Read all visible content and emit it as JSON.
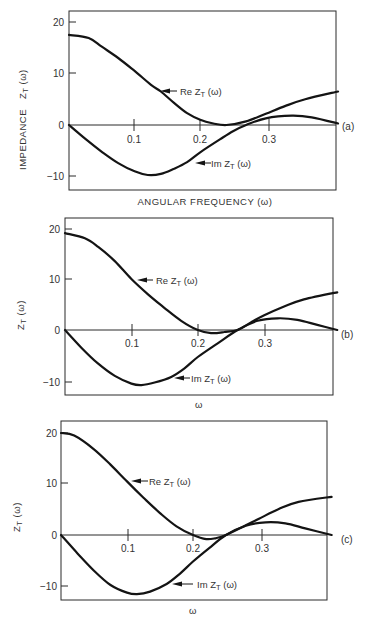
{
  "figure": {
    "panels": [
      {
        "id": "a",
        "panel_label": "(a)",
        "ylabel": "IMPEDANCE  Z_T (ω)",
        "ylabel_main": "IMPEDANCE",
        "ylabel_sym": "Z",
        "ylabel_sub": "T",
        "ylabel_arg": " (ω)",
        "xlabel": "ANGULAR FREQUENCY  (ω)",
        "re_label": "Re Z",
        "im_label": "Im Z",
        "label_sub": "T",
        "label_arg": " (ω)"
      },
      {
        "id": "b",
        "panel_label": "(b)",
        "ylabel": "Z_T (ω)",
        "ylabel_sym": "Z",
        "ylabel_sub": "T",
        "ylabel_arg": " (ω)",
        "xlabel": "ω",
        "re_label": "Re Z",
        "im_label": "Im Z",
        "label_sub": "T",
        "label_arg": " (ω)"
      },
      {
        "id": "c",
        "panel_label": "(c)",
        "ylabel": "Z_T (ω)",
        "ylabel_sym": "Z",
        "ylabel_sub": "T",
        "ylabel_arg": " (ω)",
        "xlabel": "ω",
        "re_label": "Re Z",
        "im_label": "Im Z",
        "label_sub": "T",
        "label_arg": " (ω)"
      }
    ],
    "ytick_labels": [
      "20",
      "10",
      "0",
      "−10"
    ],
    "xtick_labels": [
      "0.1",
      "0.2",
      "0.3"
    ],
    "colors": {
      "curve": "#141414",
      "axis": "#2a2a2a",
      "text": "#333333",
      "background": "#ffffff"
    }
  },
  "chart_data": [
    {
      "type": "line",
      "title": "(a)",
      "xlabel": "ANGULAR FREQUENCY (ω)",
      "ylabel": "IMPEDANCE Z_T(ω)",
      "xlim": [
        0,
        0.41
      ],
      "ylim": [
        -12,
        22
      ],
      "xticks": [
        0.1,
        0.2,
        0.3
      ],
      "yticks": [
        -10,
        0,
        10,
        20
      ],
      "grid": false,
      "legend": "inline arrow annotations",
      "series": [
        {
          "name": "Re Z_T(ω)",
          "x": [
            0,
            0.03,
            0.05,
            0.075,
            0.1,
            0.125,
            0.14,
            0.16,
            0.18,
            0.2,
            0.22,
            0.24,
            0.27,
            0.3,
            0.33,
            0.36,
            0.41
          ],
          "values": [
            17.5,
            16.9,
            15.2,
            13.0,
            10.5,
            7.8,
            6.5,
            4.3,
            2.3,
            1.0,
            0.3,
            0.0,
            0.7,
            2.2,
            3.7,
            5.0,
            6.5
          ]
        },
        {
          "name": "Im Z_T(ω)",
          "x": [
            0,
            0.025,
            0.05,
            0.075,
            0.1,
            0.12,
            0.14,
            0.16,
            0.18,
            0.2,
            0.23,
            0.25,
            0.27,
            0.3,
            0.34,
            0.37,
            0.41
          ],
          "values": [
            0,
            -2.7,
            -5.2,
            -7.4,
            -9.0,
            -9.7,
            -9.5,
            -8.5,
            -7.2,
            -5.3,
            -2.8,
            -1.2,
            0.0,
            1.3,
            1.8,
            1.5,
            0.3
          ]
        }
      ],
      "annotations": [
        "Re Z_T (ω)",
        "Im Z_T (ω)",
        "(a)"
      ]
    },
    {
      "type": "line",
      "title": "(b)",
      "xlabel": "ω",
      "ylabel": "Z_T(ω)",
      "xlim": [
        0,
        0.41
      ],
      "ylim": [
        -12,
        22
      ],
      "xticks": [
        0.1,
        0.2,
        0.3
      ],
      "yticks": [
        -10,
        0,
        10,
        20
      ],
      "grid": false,
      "legend": "inline arrow annotations",
      "series": [
        {
          "name": "Re Z_T(ω)",
          "x": [
            0,
            0.03,
            0.05,
            0.075,
            0.1,
            0.125,
            0.15,
            0.175,
            0.2,
            0.22,
            0.24,
            0.26,
            0.28,
            0.3,
            0.33,
            0.36,
            0.41
          ],
          "values": [
            19.0,
            18.0,
            16.3,
            13.5,
            10.0,
            7.0,
            4.3,
            1.8,
            0.0,
            -0.6,
            -0.4,
            0.0,
            1.5,
            2.9,
            4.6,
            6.0,
            7.4
          ]
        },
        {
          "name": "Im Z_T(ω)",
          "x": [
            0,
            0.025,
            0.05,
            0.075,
            0.1,
            0.115,
            0.135,
            0.16,
            0.18,
            0.2,
            0.23,
            0.26,
            0.29,
            0.32,
            0.35,
            0.38,
            0.41
          ],
          "values": [
            0,
            -3.5,
            -6.6,
            -9.0,
            -10.5,
            -10.8,
            -10.3,
            -9.2,
            -7.5,
            -5.3,
            -2.6,
            0.0,
            1.8,
            2.3,
            2.0,
            1.0,
            0.0
          ]
        }
      ],
      "annotations": [
        "Re Z_T (ω)",
        "Im Z_T (ω)",
        "(b)"
      ]
    },
    {
      "type": "line",
      "title": "(c)",
      "xlabel": "ω",
      "ylabel": "Z_T(ω)",
      "xlim": [
        0,
        0.41
      ],
      "ylim": [
        -12.5,
        22
      ],
      "xticks": [
        0.1,
        0.2,
        0.3
      ],
      "yticks": [
        -10,
        0,
        10,
        20
      ],
      "grid": false,
      "legend": "inline arrow annotations",
      "series": [
        {
          "name": "Re Z_T(ω)",
          "x": [
            0,
            0.02,
            0.05,
            0.075,
            0.1,
            0.125,
            0.15,
            0.175,
            0.2,
            0.22,
            0.235,
            0.25,
            0.28,
            0.3,
            0.33,
            0.36,
            0.41
          ],
          "values": [
            20.0,
            19.5,
            16.8,
            13.8,
            10.5,
            7.3,
            4.3,
            1.7,
            0.0,
            -0.8,
            -0.6,
            0.0,
            1.9,
            3.2,
            5.1,
            6.5,
            7.5
          ]
        },
        {
          "name": "Im Z_T(ω)",
          "x": [
            0,
            0.025,
            0.05,
            0.075,
            0.1,
            0.115,
            0.135,
            0.16,
            0.18,
            0.2,
            0.225,
            0.25,
            0.28,
            0.31,
            0.34,
            0.37,
            0.41
          ],
          "values": [
            0,
            -3.6,
            -7.0,
            -9.8,
            -11.3,
            -11.6,
            -11.1,
            -9.6,
            -7.6,
            -5.2,
            -2.5,
            0.0,
            1.8,
            2.5,
            2.3,
            1.3,
            0.0
          ]
        }
      ],
      "annotations": [
        "Re Z_T (ω)",
        "Im Z_T (ω)",
        "(c)"
      ]
    }
  ]
}
